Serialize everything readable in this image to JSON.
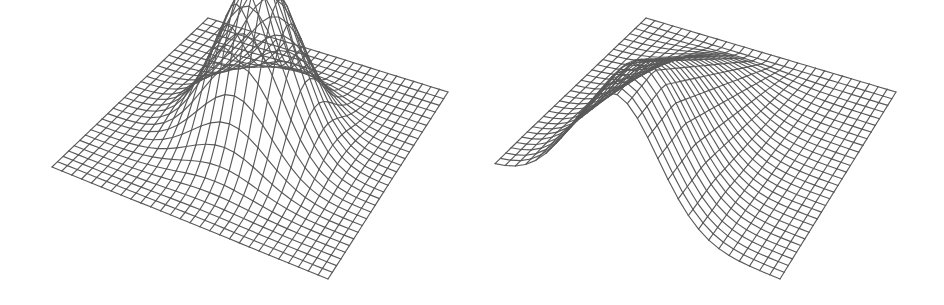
{
  "figure": {
    "line_color": "#5a5a5a",
    "background": "#ffffff"
  },
  "surfaces": [
    {
      "id": "gaussian-bump",
      "label": "2D Gaussian bump",
      "grid_cells": 28,
      "function": "bump",
      "peak_height": 1.0,
      "center": [
        0.5,
        0.5
      ],
      "sigma": 0.14
    },
    {
      "id": "gaussian-ridge",
      "label": "Gaussian ridge (1D profile along one axis)",
      "grid_cells": 28,
      "function": "ridge",
      "peak_height": 1.0,
      "center": [
        0.5,
        0.5
      ],
      "sigma": 0.15
    }
  ]
}
